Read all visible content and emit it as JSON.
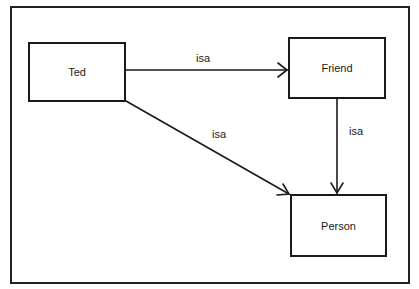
{
  "diagram": {
    "nodes": [
      {
        "id": "ted",
        "label": "Ted"
      },
      {
        "id": "friend",
        "label": "Friend"
      },
      {
        "id": "person",
        "label": "Person"
      }
    ],
    "edges": [
      {
        "from": "ted",
        "to": "friend",
        "label": "isa"
      },
      {
        "from": "ted",
        "to": "person",
        "label": "isa"
      },
      {
        "from": "friend",
        "to": "person",
        "label": "isa"
      }
    ]
  }
}
